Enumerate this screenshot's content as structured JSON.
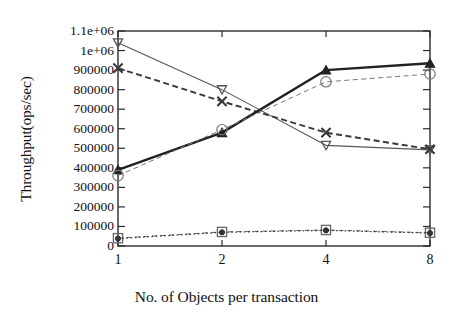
{
  "chart_data": {
    "type": "line",
    "title": "",
    "xlabel": "No. of Objects per transaction",
    "ylabel": "Throughput(ops/sec)",
    "x": [
      1,
      2,
      4,
      8
    ],
    "categories": [
      "1",
      "2",
      "4",
      "8"
    ],
    "x_tick_labels": [
      "1",
      "2",
      "4",
      "8"
    ],
    "x_scale": "log2",
    "xlim": [
      1,
      8
    ],
    "ylim": [
      0,
      1100000
    ],
    "y_tick_labels": [
      "1.1e+06",
      "1e+06",
      "900000",
      "800000",
      "700000",
      "600000",
      "500000",
      "400000",
      "300000",
      "200000",
      "100000",
      "0"
    ],
    "y_tick_values": [
      1100000,
      1000000,
      900000,
      800000,
      700000,
      600000,
      500000,
      400000,
      300000,
      200000,
      100000,
      0
    ],
    "grid": false,
    "legend": "none",
    "series": [
      {
        "name": "series-down-triangle",
        "marker": "triangle-down-open",
        "line_style": "solid-thin",
        "color": "#555555",
        "values": [
          1040000,
          800000,
          515000,
          492000
        ]
      },
      {
        "name": "series-cross",
        "marker": "x-cross",
        "line_style": "dashed",
        "color": "#3a3a3a",
        "values": [
          910000,
          740000,
          580000,
          495000
        ]
      },
      {
        "name": "series-up-triangle",
        "marker": "triangle-up-filled",
        "line_style": "solid-thick",
        "color": "#222222",
        "values": [
          390000,
          580000,
          900000,
          935000
        ]
      },
      {
        "name": "series-circle",
        "marker": "circle-open",
        "line_style": "dashed-light",
        "color": "#777777",
        "values": [
          360000,
          595000,
          840000,
          880000
        ]
      },
      {
        "name": "series-square",
        "marker": "square-open",
        "line_style": "dashed-light",
        "color": "#666666",
        "values": [
          40000,
          72000,
          82000,
          68000
        ]
      },
      {
        "name": "series-filled-circle",
        "marker": "circle-filled",
        "line_style": "dotted",
        "color": "#333333",
        "values": [
          38000,
          70000,
          80000,
          66000
        ]
      }
    ]
  }
}
